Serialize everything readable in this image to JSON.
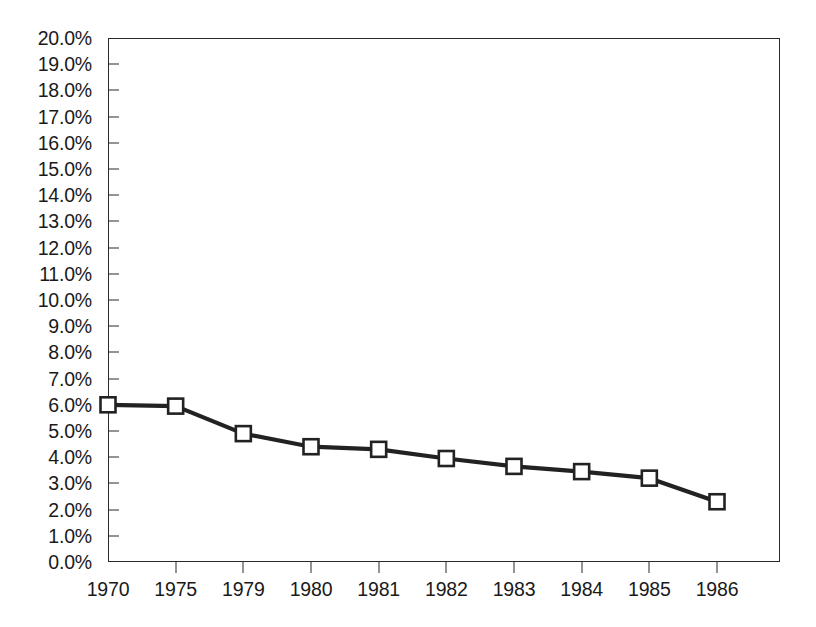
{
  "chart_data": {
    "type": "line",
    "title": "",
    "subtitle": "",
    "xlabel": "",
    "ylabel": "",
    "categories": [
      "1970",
      "1975",
      "1979",
      "1980",
      "1981",
      "1982",
      "1983",
      "1984",
      "1985",
      "1986"
    ],
    "values": [
      6.0,
      5.95,
      4.9,
      4.4,
      4.3,
      3.95,
      3.65,
      3.45,
      3.2,
      2.3
    ],
    "series": [
      {
        "name": "",
        "values": [
          6.0,
          5.95,
          4.9,
          4.4,
          4.3,
          3.95,
          3.65,
          3.45,
          3.2,
          2.3
        ]
      }
    ],
    "ylim": [
      0,
      20
    ],
    "ytick_step": 1,
    "ytick_labels": [
      "0.0%",
      "1.0%",
      "2.0%",
      "3.0%",
      "4.0%",
      "5.0%",
      "6.0%",
      "7.0%",
      "8.0%",
      "9.0%",
      "10.0%",
      "11.0%",
      "12.0%",
      "13.0%",
      "14.0%",
      "15.0%",
      "16.0%",
      "17.0%",
      "18.0%",
      "19.0%",
      "20.0%"
    ],
    "value_format": "percent",
    "grid": false,
    "legend": "none",
    "marker": "open-square",
    "line_color": "#222222",
    "marker_fill": "#ffffff",
    "marker_stroke": "#222222",
    "axis_color": "#2b2b2b",
    "background": "#ffffff"
  }
}
